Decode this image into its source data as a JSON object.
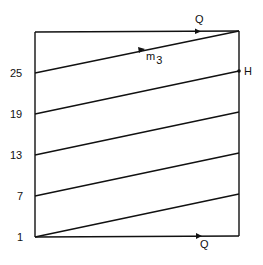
{
  "diagram": {
    "box": {
      "left": 35,
      "top": 32,
      "right": 239,
      "bottom": 236
    },
    "left_axis_labels": [
      {
        "text": "25",
        "y": 73
      },
      {
        "text": "19",
        "y": 114
      },
      {
        "text": "13",
        "y": 155
      },
      {
        "text": "7",
        "y": 196
      },
      {
        "text": "1",
        "y": 237
      }
    ],
    "slanted_lines": [
      {
        "x1": 35,
        "y1": 73,
        "x2": 239,
        "y2": 31
      },
      {
        "x1": 35,
        "y1": 114,
        "x2": 239,
        "y2": 71
      },
      {
        "x1": 35,
        "y1": 155,
        "x2": 239,
        "y2": 112
      },
      {
        "x1": 35,
        "y1": 196,
        "x2": 239,
        "y2": 153
      },
      {
        "x1": 35,
        "y1": 237,
        "x2": 239,
        "y2": 194
      }
    ],
    "labels": {
      "top_q": "Q",
      "bottom_q": "Q",
      "m3_base": "m",
      "m3_sub": "3",
      "h": "H"
    },
    "line_color": "#111111"
  }
}
